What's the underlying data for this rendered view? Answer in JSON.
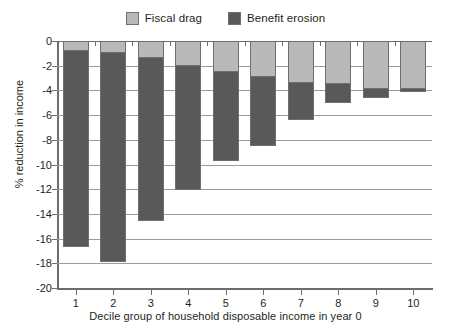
{
  "chart_data": {
    "type": "bar",
    "stacked": true,
    "title": "",
    "xlabel": "Decile group of household disposable income in year 0",
    "ylabel": "% reduction in income",
    "categories": [
      "1",
      "2",
      "3",
      "4",
      "5",
      "6",
      "7",
      "8",
      "9",
      "10"
    ],
    "ylim": [
      -20,
      0
    ],
    "ytick_labels": [
      "0",
      "-2",
      "-4",
      "-6",
      "-8",
      "-10",
      "-12",
      "-14",
      "-16",
      "-18",
      "-20"
    ],
    "ytick_values": [
      0,
      -2,
      -4,
      -6,
      -8,
      -10,
      -12,
      -14,
      -16,
      -18,
      -20
    ],
    "grid": true,
    "legend_position": "top-center",
    "series": [
      {
        "name": "Fiscal drag",
        "color": "#b9b9b9",
        "values": [
          -0.8,
          -1.0,
          -1.4,
          -2.0,
          -2.5,
          -2.9,
          -3.4,
          -3.5,
          -3.9,
          -3.9
        ]
      },
      {
        "name": "Benefit erosion",
        "color": "#595959",
        "values": [
          -15.9,
          -16.9,
          -13.2,
          -10.1,
          -7.2,
          -5.6,
          -3.0,
          -1.5,
          -0.7,
          -0.2
        ]
      }
    ],
    "totals": [
      -16.7,
      -17.9,
      -14.6,
      -12.1,
      -9.7,
      -8.5,
      -6.4,
      -5.0,
      -4.6,
      -4.1
    ]
  },
  "legend": {
    "entries": [
      {
        "label": "Fiscal drag",
        "color": "#b9b9b9"
      },
      {
        "label": "Benefit erosion",
        "color": "#595959"
      }
    ]
  },
  "axes": {
    "y_title": "% reduction in income",
    "x_title": "Decile group of household disposable income in year 0"
  }
}
